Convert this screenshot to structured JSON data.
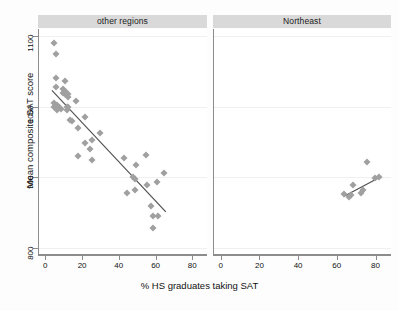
{
  "chart_data": {
    "type": "scatter",
    "title": "",
    "xlabel": "% HS graduates taking SAT",
    "ylabel": "Mean composite SAT score",
    "xlim": [
      -4,
      88
    ],
    "ylim": [
      790,
      1110
    ],
    "xticks": [
      0,
      20,
      40,
      60,
      80
    ],
    "yticks": [
      800,
      900,
      1000,
      1100
    ],
    "xtick_labels": [
      "0",
      "20",
      "40",
      "60",
      "80"
    ],
    "ytick_labels": [
      "800",
      "900",
      "1000",
      "1100"
    ],
    "grid": "horizontal-faint",
    "legend": "none",
    "marker": "diamond",
    "marker_color": "#a0a0a0",
    "fit_line_color": "#4d4d4d",
    "panel_header_color": "#d9d9d9",
    "axis_color": "#8c8c8c",
    "facets": [
      {
        "label": "other regions",
        "points": [
          {
            "x": 4,
            "y": 1090
          },
          {
            "x": 5,
            "y": 1075
          },
          {
            "x": 5,
            "y": 1040
          },
          {
            "x": 5,
            "y": 1028
          },
          {
            "x": 4,
            "y": 1005
          },
          {
            "x": 4,
            "y": 999
          },
          {
            "x": 6,
            "y": 1002
          },
          {
            "x": 6,
            "y": 996
          },
          {
            "x": 7,
            "y": 1000
          },
          {
            "x": 8,
            "y": 997
          },
          {
            "x": 9,
            "y": 1025
          },
          {
            "x": 9,
            "y": 1020
          },
          {
            "x": 10,
            "y": 1022
          },
          {
            "x": 10,
            "y": 1018
          },
          {
            "x": 10,
            "y": 1036
          },
          {
            "x": 11,
            "y": 1000
          },
          {
            "x": 11,
            "y": 996
          },
          {
            "x": 12,
            "y": 999
          },
          {
            "x": 12,
            "y": 1018
          },
          {
            "x": 12,
            "y": 1014
          },
          {
            "x": 13,
            "y": 981
          },
          {
            "x": 14,
            "y": 980
          },
          {
            "x": 16,
            "y": 1008
          },
          {
            "x": 17,
            "y": 970
          },
          {
            "x": 17,
            "y": 930
          },
          {
            "x": 21,
            "y": 985
          },
          {
            "x": 21,
            "y": 949
          },
          {
            "x": 24,
            "y": 940
          },
          {
            "x": 25,
            "y": 953
          },
          {
            "x": 25,
            "y": 925
          },
          {
            "x": 29,
            "y": 963
          },
          {
            "x": 42,
            "y": 928
          },
          {
            "x": 44,
            "y": 878
          },
          {
            "x": 47,
            "y": 900
          },
          {
            "x": 48,
            "y": 897
          },
          {
            "x": 48,
            "y": 882
          },
          {
            "x": 49,
            "y": 918
          },
          {
            "x": 54,
            "y": 932
          },
          {
            "x": 55,
            "y": 889
          },
          {
            "x": 57,
            "y": 859
          },
          {
            "x": 58,
            "y": 845
          },
          {
            "x": 58,
            "y": 828
          },
          {
            "x": 60,
            "y": 893
          },
          {
            "x": 61,
            "y": 845
          },
          {
            "x": 64,
            "y": 906
          }
        ],
        "fit_line": {
          "x1": 3,
          "y1": 1023,
          "x2": 65,
          "y2": 851
        }
      },
      {
        "label": "Northeast",
        "points": [
          {
            "x": 63,
            "y": 877
          },
          {
            "x": 66,
            "y": 872
          },
          {
            "x": 67,
            "y": 875
          },
          {
            "x": 68,
            "y": 889
          },
          {
            "x": 72,
            "y": 878
          },
          {
            "x": 73,
            "y": 882
          },
          {
            "x": 75,
            "y": 922
          },
          {
            "x": 79,
            "y": 899
          },
          {
            "x": 81,
            "y": 900
          }
        ],
        "fit_line": {
          "x1": 63,
          "y1": 873,
          "x2": 81,
          "y2": 899
        }
      }
    ]
  }
}
